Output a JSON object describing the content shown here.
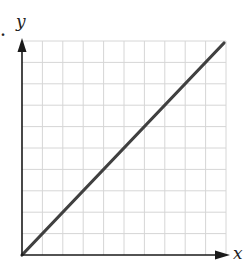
{
  "chart_data": {
    "type": "line",
    "title": "",
    "xlabel": "x",
    "ylabel": "y",
    "xlim": [
      0,
      10
    ],
    "ylim": [
      0,
      10
    ],
    "grid": true,
    "grid_divisions": {
      "x": 10,
      "y": 10
    },
    "tick_labels": false,
    "series": [
      {
        "name": "y = x",
        "x": [
          0,
          10
        ],
        "y": [
          0,
          10
        ],
        "color": "#404040"
      }
    ],
    "legend": null
  },
  "labels": {
    "x_axis": "x",
    "y_axis": "y",
    "stray_mark": "."
  },
  "colors": {
    "axis": "#1a1a1a",
    "grid": "#d6d6d6",
    "line": "#404040"
  }
}
